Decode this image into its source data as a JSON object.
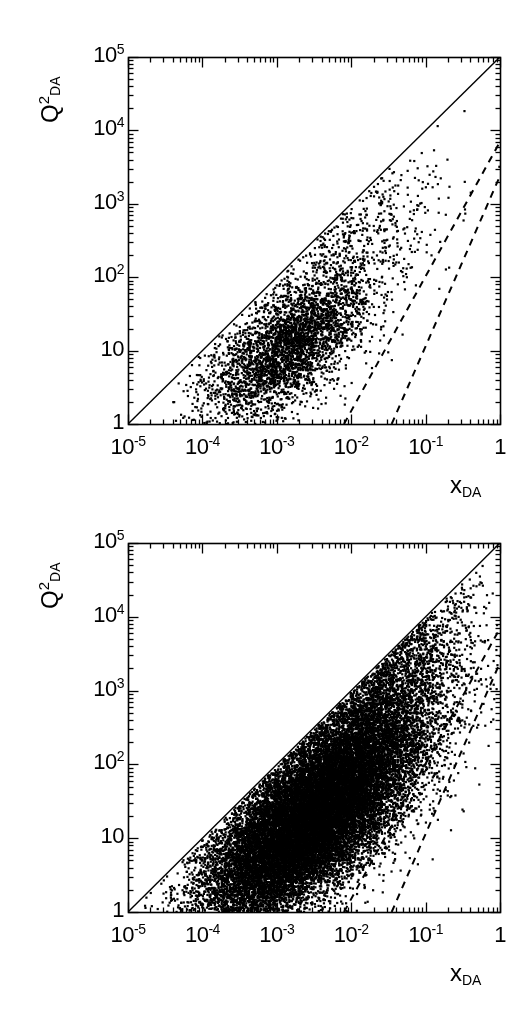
{
  "figure": {
    "kind": "two-panel-scatter",
    "background_color": "#ffffff",
    "ink_color": "#000000",
    "caption_fragment": ""
  },
  "panels": [
    {
      "id": "top",
      "name": "panel-top",
      "y_title_main": "Q",
      "y_title_sup": "2",
      "y_title_sub": "DA",
      "x_title_main": "x",
      "x_title_sub": "DA",
      "y_tick_labels": [
        "10",
        "10",
        "10",
        "10",
        "10",
        "1"
      ],
      "y_tick_exponents": [
        "5",
        "4",
        "3",
        "2",
        "",
        ""
      ],
      "x_tick_labels": [
        "10",
        "10",
        "10",
        "10",
        "10",
        "1"
      ],
      "x_tick_exponents": [
        "-5",
        "-4",
        "-3",
        "-2",
        "-1",
        ""
      ]
    },
    {
      "id": "bottom",
      "name": "panel-bottom",
      "y_title_main": "Q",
      "y_title_sup": "2",
      "y_title_sub": "DA",
      "x_title_main": "x",
      "x_title_sub": "DA",
      "y_tick_labels": [
        "10",
        "10",
        "10",
        "10",
        "10",
        "1"
      ],
      "y_tick_exponents": [
        "5",
        "4",
        "3",
        "2",
        "",
        ""
      ],
      "x_tick_labels": [
        "10",
        "10",
        "10",
        "10",
        "10",
        "1"
      ],
      "x_tick_exponents": [
        "-5",
        "-4",
        "-3",
        "-2",
        "-1",
        ""
      ]
    }
  ],
  "chart_data": [
    {
      "type": "scatter",
      "panel": "top",
      "title": "",
      "xlabel": "x_DA",
      "ylabel": "Q^2_DA",
      "xscale": "log",
      "yscale": "log",
      "xlim": [
        1e-05,
        1
      ],
      "ylim": [
        1,
        100000
      ],
      "x_ticks": [
        1e-05,
        0.0001,
        0.001,
        0.01,
        0.1,
        1
      ],
      "x_ticklabels": [
        "10^-5",
        "10^-4",
        "10^-3",
        "10^-2",
        "10^-1",
        "1"
      ],
      "y_ticks": [
        1,
        10,
        100,
        1000,
        10000,
        100000
      ],
      "y_ticklabels": [
        "1",
        "10",
        "10^2",
        "10^3",
        "10^4",
        "10^5"
      ],
      "grid": false,
      "legend": "none",
      "marker": "square",
      "marker_size_px": 2.2,
      "n_points": 4200,
      "density_seed": 17,
      "cloud": {
        "note": "Band of events between kinematic limit and low-y boundary; core concentrated near x~1e-3..1e-2, Q2~5..40",
        "core_log10x_mean": -2.85,
        "core_log10x_sigma": 0.55,
        "core_log10q2_mean": 1.05,
        "core_log10q2_sigma": 0.4,
        "tilt": 0.62,
        "tail_fraction": 0.16,
        "tail_log10x_mean": -2.0,
        "tail_log10x_sigma": 0.62,
        "tail_log10q2_offset": 0.95,
        "tail_log10q2_sigma": 0.55
      },
      "annotations": [
        {
          "name": "kinematic-limit-line",
          "style": "solid",
          "from": {
            "x": 1e-05,
            "y": 1
          },
          "to": {
            "x": 1,
            "y": 100000
          },
          "label": ""
        },
        {
          "name": "dashed-line-upper",
          "style": "dashed",
          "from": {
            "x": 0.008,
            "y": 1.0
          },
          "to": {
            "x": 1,
            "y": 7000
          },
          "label": ""
        },
        {
          "name": "dashed-line-lower",
          "style": "dashed",
          "from": {
            "x": 0.035,
            "y": 1.0
          },
          "to": {
            "x": 1,
            "y": 2400
          },
          "label": ""
        }
      ]
    },
    {
      "type": "scatter",
      "panel": "bottom",
      "title": "",
      "xlabel": "x_DA",
      "ylabel": "Q^2_DA",
      "xscale": "log",
      "yscale": "log",
      "xlim": [
        1e-05,
        1
      ],
      "ylim": [
        1,
        100000
      ],
      "x_ticks": [
        1e-05,
        0.0001,
        0.001,
        0.01,
        0.1,
        1
      ],
      "x_ticklabels": [
        "10^-5",
        "10^-4",
        "10^-3",
        "10^-2",
        "10^-1",
        "1"
      ],
      "y_ticks": [
        1,
        10,
        100,
        1000,
        10000,
        100000
      ],
      "y_ticklabels": [
        "1",
        "10",
        "10^2",
        "10^3",
        "10^4",
        "10^5"
      ],
      "grid": false,
      "legend": "none",
      "marker": "square",
      "marker_size_px": 2.2,
      "n_points": 26000,
      "density_seed": 91,
      "cloud": {
        "note": "Much denser saturated band filling the triangle between kinematic limit and low-y boundary",
        "core_log10x_mean": -2.55,
        "core_log10x_sigma": 0.72,
        "core_log10q2_mean": 1.25,
        "core_log10q2_sigma": 0.52,
        "tilt": 0.7,
        "tail_fraction": 0.18,
        "tail_log10x_mean": -1.7,
        "tail_log10x_sigma": 0.62,
        "tail_log10q2_offset": 1.05,
        "tail_log10q2_sigma": 0.6
      },
      "annotations": [
        {
          "name": "kinematic-limit-line",
          "style": "solid",
          "from": {
            "x": 1e-05,
            "y": 1
          },
          "to": {
            "x": 1,
            "y": 100000
          },
          "label": ""
        },
        {
          "name": "dashed-line-upper",
          "style": "dashed",
          "from": {
            "x": 0.008,
            "y": 1.0
          },
          "to": {
            "x": 1,
            "y": 7000
          },
          "label": ""
        },
        {
          "name": "dashed-line-lower",
          "style": "dashed",
          "from": {
            "x": 0.035,
            "y": 1.0
          },
          "to": {
            "x": 1,
            "y": 2400
          },
          "label": ""
        }
      ]
    }
  ]
}
